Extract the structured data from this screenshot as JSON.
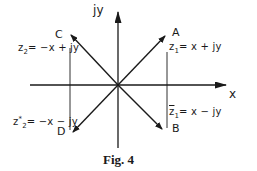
{
  "figure": {
    "caption": "Fig. 4",
    "axes": {
      "x_label": "x",
      "y_label": "jy"
    },
    "points": [
      {
        "id": "A",
        "label": "A",
        "z": "z",
        "sub": "1",
        "expr": "= x + jy",
        "quadrant": "I"
      },
      {
        "id": "B",
        "label": "B",
        "z": "z",
        "sub": "1",
        "conj": true,
        "expr": "= x − jy",
        "quadrant": "IV"
      },
      {
        "id": "C",
        "label": "C",
        "z": "z",
        "sub": "2",
        "expr": "= −x + jy",
        "quadrant": "II"
      },
      {
        "id": "D",
        "label": "D",
        "z": "z",
        "sub": "2",
        "sup": "*",
        "expr": "= −x − jy",
        "quadrant": "III"
      }
    ]
  },
  "colors": {
    "ink": "#1a1a1a",
    "background": "#ffffff"
  }
}
